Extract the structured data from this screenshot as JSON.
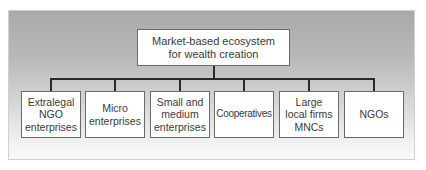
{
  "diagram": {
    "type": "hierarchy",
    "root": {
      "label": "Market-based ecosystem\nfor wealth creation"
    },
    "children": [
      {
        "label": "Extralegal\nNGO\nenterprises"
      },
      {
        "label": "Micro\nenterprises"
      },
      {
        "label": "Small and\nmedium\nenterprises"
      },
      {
        "label": "Cooperatives"
      },
      {
        "label": "Large\nlocal firms\nMNCs"
      },
      {
        "label": "NGOs"
      }
    ],
    "colors": {
      "panel_top": "#a9a9a9",
      "panel_bottom": "#fafafa",
      "box_fill": "#ffffff",
      "box_border": "#6a6a6a",
      "connector": "#2a2a2a",
      "text": "#3a3a3a"
    }
  }
}
